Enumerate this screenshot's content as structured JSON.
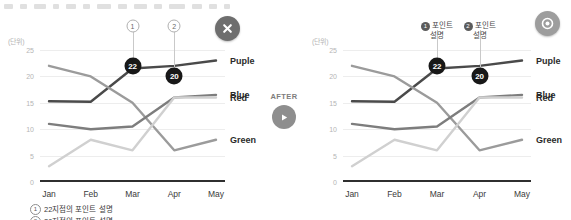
{
  "top_strip": {
    "present": true,
    "widths": [
      9,
      7,
      12,
      6,
      10,
      7,
      14,
      9,
      13,
      8,
      16,
      10,
      8,
      6
    ]
  },
  "panels": {
    "before": {
      "badge_icon": "x-mark-icon",
      "badge_label": "X",
      "has_footnotes": true
    },
    "after": {
      "badge_icon": "circle-mark-icon",
      "badge_label": "O",
      "has_footnotes": false
    }
  },
  "transition": {
    "label": "AFTER",
    "icon": "arrow-right-circle-icon"
  },
  "axis": {
    "unit_label": "(단위)",
    "y_ticks": [
      "25",
      "20",
      "15",
      "10",
      "5",
      "0"
    ],
    "x_ticks": [
      "Jan",
      "Feb",
      "Mar",
      "Apr",
      "May"
    ],
    "ylim": [
      0,
      25
    ]
  },
  "markers": [
    {
      "id": "1",
      "value": "22",
      "x_category": "Mar"
    },
    {
      "id": "2",
      "value": "20",
      "x_category": "Apr"
    }
  ],
  "callouts": [
    {
      "num": "①",
      "num_plain": "1",
      "line1": "포인트",
      "line2": "설명"
    },
    {
      "num": "②",
      "num_plain": "2",
      "line1": "포인트",
      "line2": "설명"
    }
  ],
  "footnotes": [
    {
      "num": "①",
      "text": "22지점의 포인트 설명"
    },
    {
      "num": "②",
      "text": "20지점의 포인트 설명"
    }
  ],
  "colors": {
    "purple": "#4a4a4a",
    "green": "#9b9b9b",
    "blue": "#7d7d7d",
    "red": "#d0d0d0",
    "axis": "#2f2f2f",
    "grid": "#ededed",
    "marker": "#181818"
  },
  "chart_data": {
    "type": "line",
    "title": "",
    "xlabel": "",
    "ylabel": "(단위)",
    "categories": [
      "Jan",
      "Feb",
      "Mar",
      "Apr",
      "May"
    ],
    "ylim": [
      0,
      25
    ],
    "grid": true,
    "legend": "right-inline",
    "series": [
      {
        "name": "Puple",
        "color": "#4a4a4a",
        "values": [
          15.3,
          15.2,
          21.5,
          22.0,
          23.0
        ]
      },
      {
        "name": "Green",
        "color": "#9b9b9b",
        "values": [
          22.0,
          20.0,
          15.0,
          6.0,
          8.0
        ]
      },
      {
        "name": "Blue",
        "color": "#7d7d7d",
        "values": [
          11.0,
          10.0,
          10.5,
          16.0,
          16.5
        ]
      },
      {
        "name": "Red",
        "color": "#d0d0d0",
        "values": [
          3.0,
          8.0,
          6.0,
          16.0,
          16.0
        ]
      }
    ],
    "annotations": [
      {
        "label": "22",
        "category": "Mar",
        "value": 22.0
      },
      {
        "label": "20",
        "category": "Apr",
        "value": 20.0
      }
    ]
  }
}
